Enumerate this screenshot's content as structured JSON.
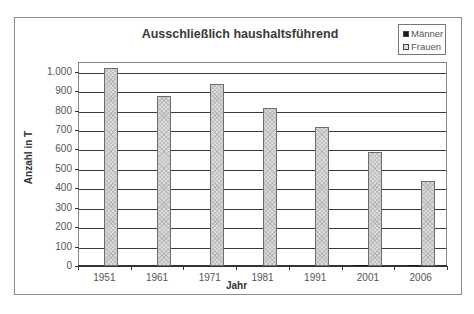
{
  "chart_data": {
    "type": "bar",
    "title": "Ausschließlich haushaltsführend",
    "xlabel": "Jahr",
    "ylabel": "Anzahl in T",
    "categories": [
      "1951",
      "1961",
      "1971",
      "1981",
      "1991",
      "2001",
      "2006"
    ],
    "series": [
      {
        "name": "Männer",
        "color": "#1a1a1a",
        "values": [
          0,
          0,
          0,
          0,
          0,
          5,
          5
        ]
      },
      {
        "name": "Frauen",
        "color": "#dcdcdc",
        "values": [
          1019,
          877,
          938,
          815,
          715,
          588,
          439
        ]
      }
    ],
    "ylim": [
      0,
      1000
    ],
    "yticks": [
      "0",
      "100",
      "200",
      "300",
      "400",
      "500",
      "600",
      "700",
      "800",
      "900",
      "1.000"
    ],
    "grid": true,
    "legend_position": "top-right"
  },
  "legend": {
    "items": [
      {
        "label": "Männer",
        "color": "#1a1a1a"
      },
      {
        "label": "Frauen",
        "color": "#dcdcdc"
      }
    ]
  }
}
